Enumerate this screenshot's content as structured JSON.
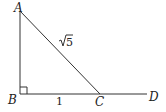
{
  "diagram": {
    "type": "geometry",
    "points": {
      "A": {
        "label": "A",
        "x": 20,
        "y": 11
      },
      "B": {
        "label": "B",
        "x": 20,
        "y": 94
      },
      "C": {
        "label": "C",
        "x": 100,
        "y": 94
      },
      "D": {
        "label": "D",
        "x": 147,
        "y": 94
      }
    },
    "segments": [
      {
        "from": "A",
        "to": "B"
      },
      {
        "from": "B",
        "to": "D"
      },
      {
        "from": "A",
        "to": "C"
      }
    ],
    "right_angle_at": "B",
    "measurements": {
      "BC": "1",
      "AC_radicand": "5"
    }
  }
}
